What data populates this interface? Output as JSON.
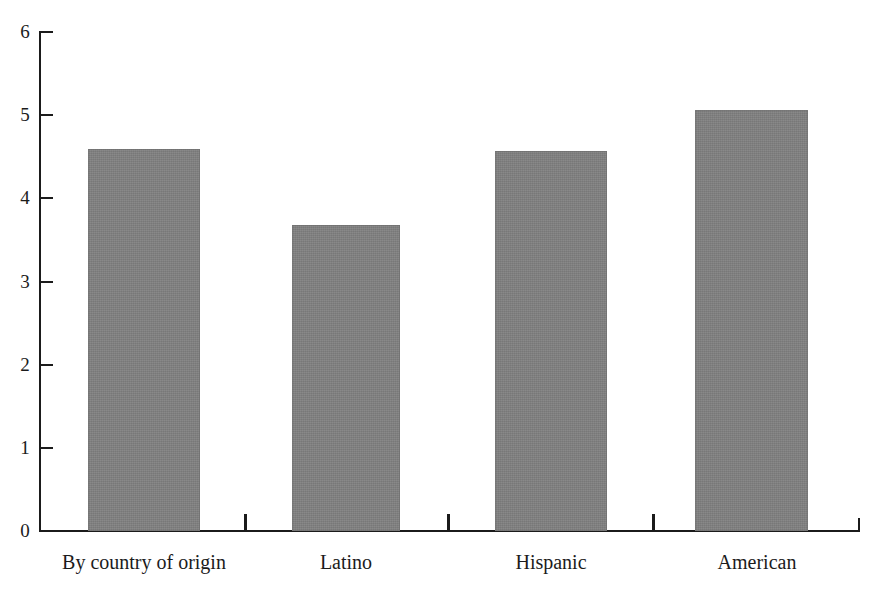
{
  "chart_data": {
    "type": "bar",
    "title": "",
    "subtitle": "",
    "xlabel": "",
    "ylabel": "",
    "categories": [
      "By country of origin",
      "Latino",
      "Hispanic",
      "American"
    ],
    "values": [
      4.58,
      3.67,
      4.56,
      5.05
    ],
    "series": [
      {
        "name": "",
        "values": [
          4.58,
          3.67,
          4.56,
          5.05
        ]
      }
    ],
    "ylim": [
      0,
      6
    ],
    "y_ticks": [
      0,
      1,
      2,
      3,
      4,
      5,
      6
    ],
    "y_tick_labels": [
      "0",
      "1",
      "2",
      "3",
      "4",
      "5",
      "6"
    ],
    "x_tick_labels": [
      "By country of origin",
      "Latino",
      "Hispanic",
      "American"
    ],
    "grid": false,
    "legend": false,
    "legend_position": "none",
    "bar_color": "#808080",
    "axis_color": "#1b1b1b",
    "background_color": "#ffffff",
    "annotations": []
  },
  "axis": {
    "y_labels": [
      {
        "text": "6",
        "value": 6
      },
      {
        "text": "5",
        "value": 5
      },
      {
        "text": "4",
        "value": 4
      },
      {
        "text": "3",
        "value": 3
      },
      {
        "text": "2",
        "value": 2
      },
      {
        "text": "1",
        "value": 1
      },
      {
        "text": "0",
        "value": 0
      }
    ]
  },
  "bars": [
    {
      "label": "By country of origin",
      "value": 4.58
    },
    {
      "label": "Latino",
      "value": 3.67
    },
    {
      "label": "Hispanic",
      "value": 4.56
    },
    {
      "label": "American",
      "value": 5.05
    }
  ]
}
